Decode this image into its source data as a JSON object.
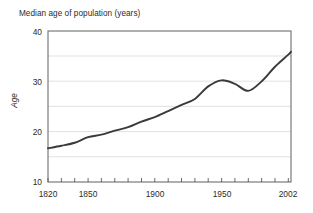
{
  "chart_data": {
    "type": "line",
    "title": "Median age of population (years)",
    "xlabel": "",
    "ylabel": "Age",
    "xlim": [
      1820,
      2002
    ],
    "ylim": [
      10,
      40
    ],
    "ytick_labels": [
      "10",
      "20",
      "30",
      "40"
    ],
    "yticks": [
      10,
      20,
      30,
      40
    ],
    "gridlines_y": [
      15,
      20,
      25,
      30,
      35
    ],
    "xtick_labels": [
      "1820",
      "1850",
      "1900",
      "1950",
      "2002"
    ],
    "xticks": [
      1820,
      1850,
      1900,
      1950,
      2002
    ],
    "xtick_minor_step": 10,
    "grid": "horizontal",
    "legend": "none",
    "line_color": "#3a3a3a",
    "line_width": 1.9,
    "x": [
      1820,
      1830,
      1840,
      1850,
      1860,
      1870,
      1880,
      1890,
      1900,
      1910,
      1920,
      1930,
      1940,
      1950,
      1960,
      1970,
      1980,
      1990,
      2000,
      2002
    ],
    "values": [
      16.7,
      17.2,
      17.8,
      18.9,
      19.4,
      20.2,
      20.9,
      22.0,
      22.9,
      24.1,
      25.3,
      26.5,
      29.0,
      30.2,
      29.5,
      28.1,
      30.0,
      32.9,
      35.3,
      35.9
    ],
    "series": [
      {
        "name": "Median age",
        "values": [
          16.7,
          17.2,
          17.8,
          18.9,
          19.4,
          20.2,
          20.9,
          22.0,
          22.9,
          24.1,
          25.3,
          26.5,
          29.0,
          30.2,
          29.5,
          28.1,
          30.0,
          32.9,
          35.3,
          35.9
        ]
      }
    ],
    "annotations": {
      "peak": {
        "x": 1950,
        "y": 30.2
      },
      "trough": {
        "x": 1970,
        "y": 28.1
      },
      "start": {
        "x": 1820,
        "y": 16.7
      },
      "end": {
        "x": 2002,
        "y": 35.9
      }
    }
  },
  "axes": {
    "y_ticks": [
      {
        "label": "40",
        "value": 40
      },
      {
        "label": "30",
        "value": 30
      },
      {
        "label": "20",
        "value": 20
      },
      {
        "label": "10",
        "value": 10
      }
    ],
    "x_ticks": [
      {
        "label": "1820",
        "value": 1820
      },
      {
        "label": "1850",
        "value": 1850
      },
      {
        "label": "1900",
        "value": 1900
      },
      {
        "label": "1950",
        "value": 1950
      },
      {
        "label": "2002",
        "value": 2002
      }
    ]
  },
  "colors": {
    "background": "#ffffff",
    "line": "#3a3a3a",
    "frame": "#6e6e6e",
    "grid": "#d8d8d8",
    "text": "#2b2b2b"
  }
}
